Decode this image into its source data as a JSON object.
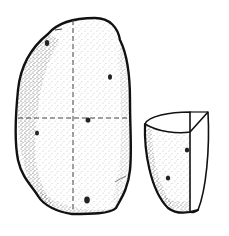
{
  "illustration": {
    "subject": "potato-with-seed-piece",
    "colors": {
      "background": "#ffffff",
      "outline": "#111111",
      "stipple": "#333333",
      "cut-line": "#444444"
    },
    "whole_potato": {
      "eyes": 5,
      "cut_lines": [
        "vertical",
        "horizontal"
      ]
    },
    "seed_piece": {
      "eyes": 2
    }
  }
}
